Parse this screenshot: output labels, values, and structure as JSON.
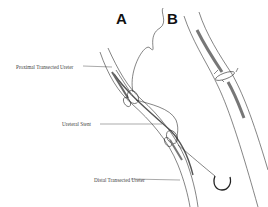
{
  "panels": [
    {
      "id": "A",
      "label": "A"
    },
    {
      "id": "B",
      "label": "B"
    }
  ],
  "annotations": {
    "proximal": "Proximal Transected Ureter",
    "stent": "Ureteral Stent",
    "distal": "Distal Transected Ureter"
  },
  "colors": {
    "line": "#333333",
    "shade": "#777777",
    "background": "#ffffff"
  }
}
